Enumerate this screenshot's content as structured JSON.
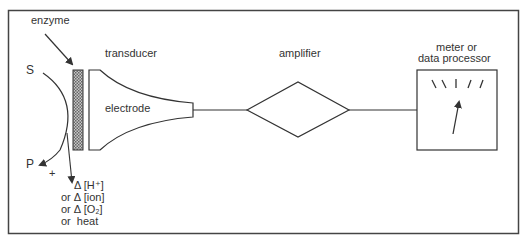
{
  "diagram": {
    "labels": {
      "enzyme": "enzyme",
      "transducer": "transducer",
      "electrode": "electrode",
      "amplifier": "amplifier",
      "meter_line1": "meter or",
      "meter_line2": "data processor",
      "substrate": "S",
      "product": "P",
      "plus": "+"
    },
    "outputs": [
      {
        "prefix": "",
        "delta": "Δ",
        "text": "[H⁺]"
      },
      {
        "prefix": "or",
        "delta": "Δ",
        "text": "[ion]"
      },
      {
        "prefix": "or",
        "delta": "Δ",
        "text": "[O₂]"
      },
      {
        "prefix": "or",
        "delta": "",
        "text": "heat"
      }
    ],
    "colors": {
      "stroke": "#333333",
      "membrane_fill": "#9a9a9a",
      "background": "#ffffff"
    }
  }
}
